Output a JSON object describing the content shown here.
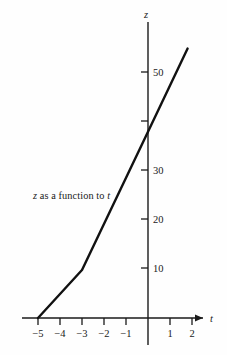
{
  "chart_data": {
    "type": "line",
    "title": "",
    "caption": "z as a function to t",
    "caption_var_x": "t",
    "caption_var_y": "z",
    "xlabel": "t",
    "ylabel": "z",
    "xlim": [
      -5.8,
      2.6
    ],
    "ylim": [
      -4,
      60
    ],
    "grid": false,
    "legend": null,
    "x_ticks": [
      -5,
      -4,
      -3,
      -2,
      -1,
      0,
      1,
      2
    ],
    "x_tick_labels": [
      "−5",
      "−4",
      "−3",
      "−2",
      "−1",
      "",
      "1",
      "2"
    ],
    "y_ticks": [
      10,
      20,
      30,
      40,
      50
    ],
    "y_tick_labels": [
      "10",
      "20",
      "30",
      "40",
      "50"
    ],
    "y_tick_labels_shown": [
      "10",
      "20",
      "30",
      "",
      "50"
    ],
    "series": [
      {
        "name": "z(t)",
        "color": "#111111",
        "points": [
          {
            "t": -5.0,
            "z": 0
          },
          {
            "t": -3.0,
            "z": 9.8
          },
          {
            "t": 0.0,
            "z": 38
          },
          {
            "t": 1.8,
            "z": 55
          }
        ]
      }
    ],
    "axis_arrows": {
      "x_right": true,
      "y_top": false
    },
    "colors": {
      "axis": "#1a1a1a",
      "curve": "#111111",
      "background": "#fefefe"
    }
  },
  "figure": {
    "y_axis_label": "z",
    "x_axis_label": "t"
  }
}
